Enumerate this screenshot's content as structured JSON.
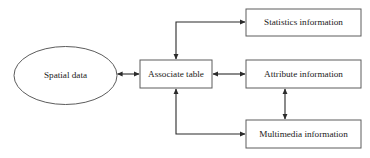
{
  "diagram": {
    "background_color": "#ffffff",
    "line_color": "#2b2b2b",
    "box_border_color": "#5c5c5c",
    "text_color": "#1a1a1a",
    "nodes": [
      {
        "id": "spatial-data",
        "label": "Spatial data",
        "shape": "ellipse",
        "cx": 65.5,
        "cy": 75.5,
        "rx": 51.5,
        "ry": 29
      },
      {
        "id": "associate-table",
        "label": "Associate table",
        "shape": "rect",
        "x": 140,
        "y": 60,
        "width": 72,
        "height": 28
      },
      {
        "id": "statistics-information",
        "label": "Statistics information",
        "shape": "rect",
        "x": 246,
        "y": 9,
        "width": 115,
        "height": 27
      },
      {
        "id": "attribute-information",
        "label": "Attribute information",
        "shape": "rect",
        "x": 246,
        "y": 60,
        "width": 115,
        "height": 28
      },
      {
        "id": "multimedia-information",
        "label": "Multimedia information",
        "shape": "rect",
        "x": 246,
        "y": 120,
        "width": 115,
        "height": 28
      }
    ],
    "connectors": [
      {
        "id": "spatial-to-associate",
        "from": "spatial-data",
        "to": "associate-table",
        "arrows": "both",
        "path": "M 117.5 74 L 139 74"
      },
      {
        "id": "associate-to-statistics",
        "from": "associate-table",
        "to": "statistics-information",
        "arrows": "both",
        "path": "M 176 59 L 176 22 L 245 22"
      },
      {
        "id": "associate-to-attribute",
        "from": "associate-table",
        "to": "attribute-information",
        "arrows": "both",
        "path": "M 213 74 L 245 74"
      },
      {
        "id": "associate-to-multimedia",
        "from": "associate-table",
        "to": "multimedia-information",
        "arrows": "both",
        "path": "M 176 89 L 176 134 L 245 134"
      },
      {
        "id": "attribute-to-multimedia",
        "from": "attribute-information",
        "to": "multimedia-information",
        "arrows": "both",
        "path": "M 285 89 L 285 119"
      }
    ]
  }
}
